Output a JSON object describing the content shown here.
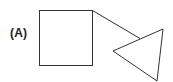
{
  "figure": {
    "label": "(A)",
    "stroke_color": "#333333",
    "background": "#ffffff",
    "shapes": {
      "square": {
        "x": 39,
        "y": 10,
        "width": 53,
        "height": 55
      },
      "connector": {
        "x1": 92,
        "y1": 10,
        "x2": 140,
        "y2": 38
      },
      "triangle": {
        "points": [
          [
            163,
            29
          ],
          [
            113,
            51
          ],
          [
            157,
            81
          ]
        ]
      }
    }
  }
}
